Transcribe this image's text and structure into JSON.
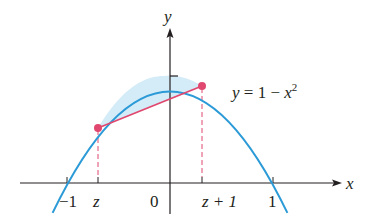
{
  "figure": {
    "type": "function-plot",
    "curve_equation_label": {
      "lhs": "y",
      "eq": " = 1 − ",
      "var": "x",
      "exp": "2"
    },
    "axis_labels": {
      "x": "x",
      "y": "y"
    },
    "tick_labels": [
      {
        "text": "−1",
        "italic": false
      },
      {
        "text": "z",
        "italic": true
      },
      {
        "text": "0",
        "italic": false
      },
      {
        "text": "z + 1",
        "italic": true
      },
      {
        "text": "1",
        "italic": false
      }
    ],
    "colors": {
      "curve": "#2b9ad6",
      "fill": "#d4ebf8",
      "chord": "#e0486f",
      "point": "#e0486f",
      "axis": "#231f20"
    },
    "points": [
      {
        "name": "z",
        "x": -0.7,
        "y": 0.51
      },
      {
        "name": "z+1",
        "x": 0.3,
        "y": 0.91
      }
    ]
  }
}
